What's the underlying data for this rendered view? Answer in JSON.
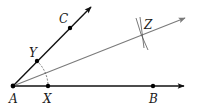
{
  "diagram": {
    "type": "angle-bisector-construction",
    "colors": {
      "ray": "#111111",
      "bisector": "#7a7a7a",
      "arc": "#555555",
      "point": "#000000",
      "label": "#1a1a1a"
    },
    "points": {
      "A": {
        "label": "A",
        "x": 13,
        "y": 86
      },
      "X": {
        "label": "X",
        "x": 48,
        "y": 86
      },
      "B": {
        "label": "B",
        "x": 153,
        "y": 86
      },
      "Y": {
        "label": "Y",
        "x": 37,
        "y": 61
      },
      "C": {
        "label": "C",
        "x": 70,
        "y": 28
      },
      "Z": {
        "label": "Z",
        "x": 143,
        "y": 33
      }
    },
    "rays": [
      {
        "name": "AB",
        "from": "A",
        "through": "B"
      },
      {
        "name": "AC",
        "from": "A",
        "through": "C"
      },
      {
        "name": "AZ",
        "from": "A",
        "through": "Z"
      }
    ]
  }
}
